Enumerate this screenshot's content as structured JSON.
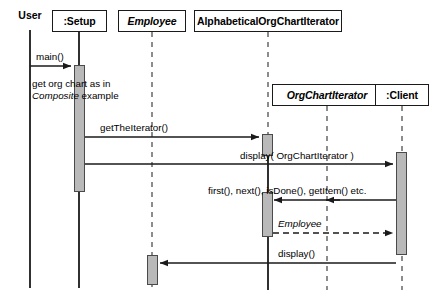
{
  "diagram": {
    "type": "uml-sequence-diagram",
    "width": 437,
    "height": 296,
    "colors": {
      "background": "#ffffff",
      "line": "#1a1a1a",
      "lifeline_dashed": "#8c8c8c",
      "activation_fill": "#b9b9b9",
      "activation_border": "#4a4a4a",
      "text": "#000000"
    }
  },
  "participants": [
    {
      "id": "user",
      "label": "User",
      "style": "plain-label",
      "abstract": false,
      "x": 30,
      "box": null,
      "lifeline": {
        "top": 30,
        "bottom": 288,
        "style": "solid"
      }
    },
    {
      "id": "setup",
      "label": ":Setup",
      "style": "boxed",
      "abstract": false,
      "x": 79,
      "box": {
        "x": 52,
        "y": 10,
        "w": 55,
        "h": 22
      },
      "lifeline": {
        "top": 32,
        "bottom": 288,
        "style": "solid"
      }
    },
    {
      "id": "employee",
      "label": "Employee",
      "style": "boxed",
      "abstract": true,
      "x": 152,
      "box": {
        "x": 118,
        "y": 10,
        "w": 68,
        "h": 22
      },
      "lifeline": {
        "top": 32,
        "bottom": 290,
        "style": "dashed"
      }
    },
    {
      "id": "alphabeticaliterator",
      "label": "AlphabeticalOrgChartIterator",
      "style": "boxed",
      "abstract": false,
      "x": 268,
      "box": {
        "x": 194,
        "y": 10,
        "w": 148,
        "h": 22
      },
      "lifeline": {
        "top": 32,
        "bottom": 290,
        "style": "dashed-then-solid",
        "solid_from": 140
      }
    },
    {
      "id": "orgchartiterator",
      "label": "OrgChartIterator",
      "style": "boxed",
      "abstract": true,
      "x": 327,
      "box": {
        "x": 272,
        "y": 84,
        "w": 110,
        "h": 22
      },
      "lifeline": {
        "top": 106,
        "bottom": 290,
        "style": "dashed"
      }
    },
    {
      "id": "client",
      "label": ":Client",
      "style": "boxed",
      "abstract": false,
      "x": 402,
      "box": {
        "x": 375,
        "y": 84,
        "w": 54,
        "h": 22
      },
      "lifeline": {
        "top": 106,
        "bottom": 290,
        "style": "dashed"
      }
    }
  ],
  "activations": [
    {
      "id": "act-setup",
      "participant": "setup",
      "x": 74,
      "y": 65,
      "w": 11,
      "h": 127
    },
    {
      "id": "act-alpha-create",
      "participant": "alphabeticaliterator",
      "x": 262,
      "y": 134,
      "w": 11,
      "h": 22
    },
    {
      "id": "act-alpha-iterate",
      "participant": "alphabeticaliterator",
      "x": 262,
      "y": 192,
      "w": 11,
      "h": 45
    },
    {
      "id": "act-client",
      "participant": "client",
      "x": 396,
      "y": 152,
      "w": 11,
      "h": 103
    },
    {
      "id": "act-employee",
      "participant": "employee",
      "x": 147,
      "y": 255,
      "w": 11,
      "h": 30
    }
  ],
  "messages": [
    {
      "id": "msg-main",
      "label": "main()",
      "from": "user",
      "to": "setup",
      "y": 66,
      "x1": 30,
      "x2": 72,
      "style": "solid",
      "arrow": "filled",
      "direction": "right",
      "label_x": 36,
      "label_y": 51,
      "italic": false
    },
    {
      "id": "msg-gettheiterator",
      "label": "getTheIterator()",
      "from": "setup",
      "to": "alphabeticaliterator",
      "y": 137,
      "x1": 85,
      "x2": 260,
      "style": "solid",
      "arrow": "filled",
      "direction": "right",
      "label_x": 100,
      "label_y": 122,
      "italic": false
    },
    {
      "id": "msg-display-iterator",
      "label": "display( OrgChartIterator )",
      "from": "alphabeticaliterator",
      "to": "client",
      "y": 164,
      "x1": 85,
      "x2": 394,
      "style": "solid",
      "arrow": "filled",
      "direction": "right",
      "label_x": 240,
      "label_y": 150,
      "italic": false
    },
    {
      "id": "msg-iterator-ops",
      "label": "first(), next(), isDone(), getItem() etc.",
      "from": "client",
      "to": "alphabeticaliterator",
      "y": 200,
      "x1": 396,
      "x2": 273,
      "style": "solid",
      "arrow": "filled",
      "direction": "left",
      "mid_arrow_x": 327,
      "label_x": 208,
      "label_y": 185,
      "italic": false
    },
    {
      "id": "msg-return-employee",
      "label": "Employee",
      "from": "alphabeticaliterator",
      "to": "client",
      "y": 233,
      "x1": 273,
      "x2": 394,
      "style": "dashed",
      "arrow": "filled",
      "direction": "right",
      "label_x": 278,
      "label_y": 218,
      "italic": true
    },
    {
      "id": "msg-display",
      "label": "display()",
      "from": "client",
      "to": "employee",
      "y": 263,
      "x1": 396,
      "x2": 159,
      "style": "solid",
      "arrow": "filled",
      "direction": "left",
      "label_x": 278,
      "label_y": 248,
      "italic": false
    }
  ],
  "notes": [
    {
      "id": "note-composite",
      "text_line1": "get org chart as in",
      "text_italic": "Composite",
      "text_after": " example",
      "x": 32,
      "y": 78
    }
  ]
}
